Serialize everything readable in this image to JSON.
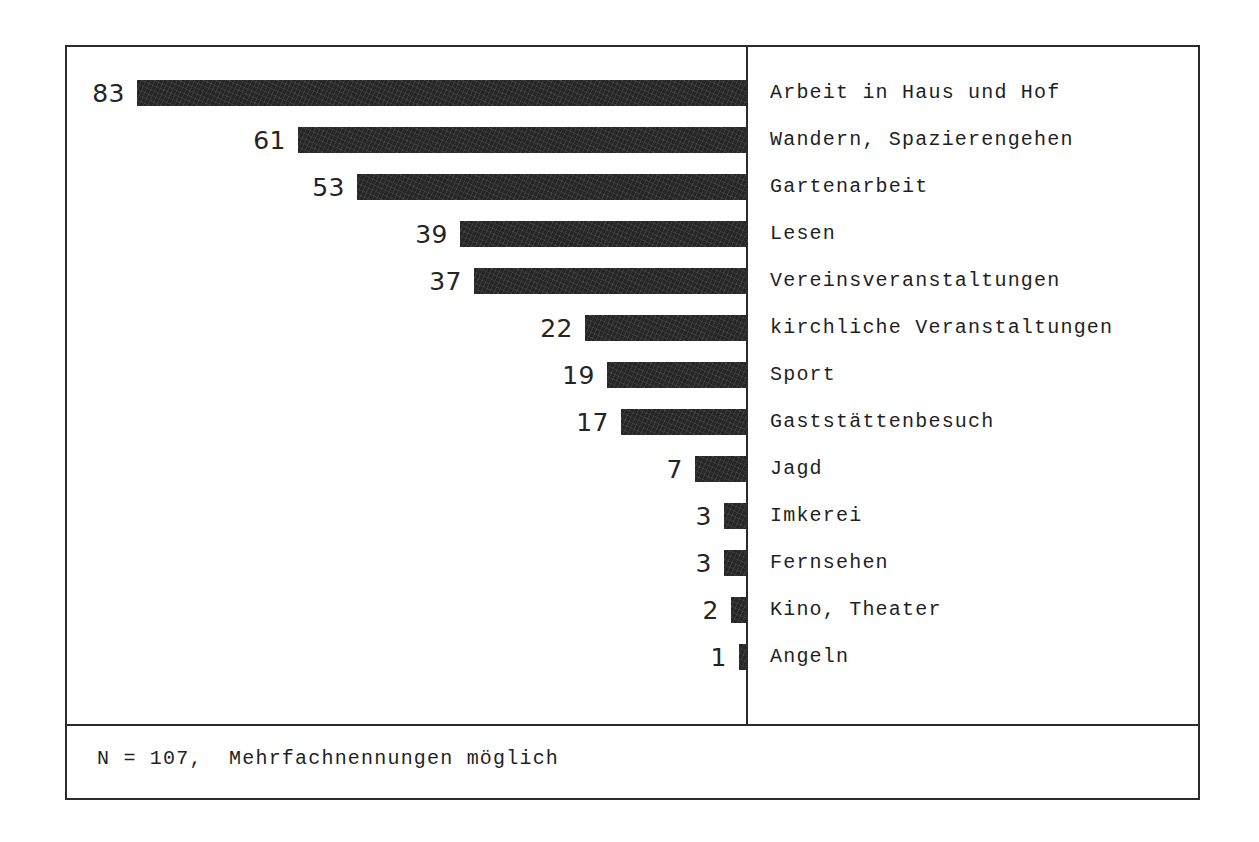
{
  "chart_data": {
    "type": "bar",
    "orientation": "horizontal-right-aligned",
    "title": "",
    "subtitle": "",
    "xlabel": "",
    "ylabel": "",
    "grid": false,
    "legend": null,
    "axis_baseline": "right",
    "xlim": [
      0,
      83
    ],
    "categories": [
      "Arbeit in Haus und Hof",
      "Wandern, Spazierengehen",
      "Gartenarbeit",
      "Lesen",
      "Vereinsveranstaltungen",
      "kirchliche Veranstaltungen",
      "Sport",
      "Gaststättenbesuch",
      "Jagd",
      "Imkerei",
      "Fernsehen",
      "Kino, Theater",
      "Angeln"
    ],
    "values": [
      83,
      61,
      53,
      39,
      37,
      22,
      19,
      17,
      7,
      3,
      3,
      2,
      1
    ],
    "value_labels": [
      "83",
      "61",
      "53",
      "39",
      "37",
      "22",
      "19",
      "17",
      "7",
      "3",
      "3",
      "2",
      "1"
    ],
    "annotation": "N = 107,  Mehrfachnennungen möglich"
  },
  "figure": {
    "footnote": "N = 107,  Mehrfachnennungen möglich",
    "bar_color": "#262626",
    "frame_color": "#2b2b2b",
    "background_color": "#ffffff"
  },
  "rows": [
    {
      "value": "83",
      "label": "Arbeit in Haus und Hof"
    },
    {
      "value": "61",
      "label": "Wandern, Spazierengehen"
    },
    {
      "value": "53",
      "label": "Gartenarbeit"
    },
    {
      "value": "39",
      "label": "Lesen"
    },
    {
      "value": "37",
      "label": "Vereinsveranstaltungen"
    },
    {
      "value": "22",
      "label": "kirchliche Veranstaltungen"
    },
    {
      "value": "19",
      "label": "Sport"
    },
    {
      "value": "17",
      "label": "Gaststättenbesuch"
    },
    {
      "value": "7",
      "label": "Jagd"
    },
    {
      "value": "3",
      "label": "Imkerei"
    },
    {
      "value": "3",
      "label": "Fernsehen"
    },
    {
      "value": "2",
      "label": "Kino, Theater"
    },
    {
      "value": "1",
      "label": "Angeln"
    }
  ]
}
